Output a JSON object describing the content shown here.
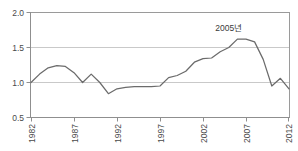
{
  "chart_data": {
    "type": "line",
    "title": "",
    "xlabel": "",
    "ylabel": "",
    "ylim": [
      0.5,
      2.0
    ],
    "xlim": [
      1982,
      2012
    ],
    "grid": true,
    "legend": null,
    "y_ticks": [
      "2.0",
      "1.5",
      "1.0",
      "0.5"
    ],
    "y_tick_values": [
      2.0,
      1.5,
      1.0,
      0.5
    ],
    "x_ticks": [
      "1982",
      "1987",
      "1992",
      "1997",
      "2002",
      "2007",
      "2012"
    ],
    "x_tick_values": [
      1982,
      1987,
      1992,
      1997,
      2002,
      2007,
      2012
    ],
    "annotations": [
      {
        "text": "2005년",
        "x": 2005,
        "y": 1.62
      }
    ],
    "x": [
      1982,
      1983,
      1984,
      1985,
      1986,
      1987,
      1988,
      1989,
      1990,
      1991,
      1992,
      1993,
      1994,
      1995,
      1996,
      1997,
      1998,
      1999,
      2000,
      2001,
      2002,
      2003,
      2004,
      2005,
      2006,
      2007,
      2008,
      2009,
      2010,
      2011,
      2012
    ],
    "values": [
      1.0,
      1.12,
      1.21,
      1.24,
      1.23,
      1.14,
      1.0,
      1.12,
      1.0,
      0.84,
      0.91,
      0.93,
      0.94,
      0.94,
      0.94,
      0.95,
      1.07,
      1.1,
      1.16,
      1.29,
      1.34,
      1.35,
      1.44,
      1.5,
      1.62,
      1.62,
      1.58,
      1.33,
      0.95,
      1.06,
      0.91
    ],
    "series_color": "#6b6b6b",
    "grid_color": "#c9c9c9",
    "axis_color": "#8f8f8f"
  }
}
